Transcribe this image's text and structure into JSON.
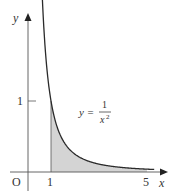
{
  "chart_data": {
    "type": "line",
    "title": "",
    "function_label": {
      "lhs": "y =",
      "numerator": "1",
      "denominator": "x",
      "exponent": "2"
    },
    "xlabel": "x",
    "ylabel": "y",
    "origin_label": "O",
    "x_ticks": [
      {
        "value": 1,
        "label": "1"
      },
      {
        "value": 5,
        "label": "5"
      }
    ],
    "y_ticks": [
      {
        "value": 1,
        "label": "1"
      }
    ],
    "shaded_region": {
      "x_from": 1,
      "x_to": 5,
      "description": "area under y = 1/x^2 from x = 1 to x = 5"
    },
    "x": [
      0.625,
      0.75,
      1,
      1.5,
      2,
      2.5,
      3,
      3.5,
      4,
      4.5,
      5,
      5.3
    ],
    "series": [
      {
        "name": "y = 1/x^2",
        "values": [
          2.56,
          1.78,
          1,
          0.444,
          0.25,
          0.16,
          0.111,
          0.082,
          0.0625,
          0.049,
          0.04,
          0.036
        ]
      }
    ],
    "xlim": [
      -0.7,
      5.8
    ],
    "ylim": [
      0,
      2.2
    ],
    "grid": false,
    "colors": {
      "curve": "#2a2a2a",
      "shade": "#d4d4d4",
      "axis": "#555555"
    }
  }
}
